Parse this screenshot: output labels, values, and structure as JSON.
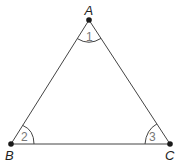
{
  "diagram": {
    "type": "triangle",
    "colors": {
      "line": "#444444",
      "vertex": "#1a1a1a",
      "angle_label": "#777777",
      "vertex_label": "#222222"
    },
    "vertices": [
      {
        "id": "A",
        "label": "A",
        "x": 89,
        "y": 20
      },
      {
        "id": "B",
        "label": "B",
        "x": 11,
        "y": 144
      },
      {
        "id": "C",
        "label": "C",
        "x": 170,
        "y": 144
      }
    ],
    "edges": [
      [
        "A",
        "B"
      ],
      [
        "A",
        "C"
      ],
      [
        "B",
        "C"
      ]
    ],
    "angles": [
      {
        "vertex": "A",
        "label": "1"
      },
      {
        "vertex": "B",
        "label": "2"
      },
      {
        "vertex": "C",
        "label": "3"
      }
    ]
  }
}
